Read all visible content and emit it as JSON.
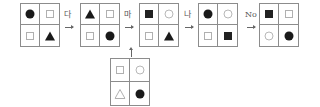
{
  "sequence": {
    "grids": [
      {
        "id": "grid-1",
        "cells": [
          "circle-filled",
          "square-empty",
          "square-empty",
          "triangle-filled"
        ]
      },
      {
        "id": "grid-2",
        "cells": [
          "triangle-filled",
          "square-empty",
          "square-empty",
          "circle-filled"
        ]
      },
      {
        "id": "grid-3",
        "cells": [
          "square-filled",
          "circle-empty",
          "square-empty",
          "triangle-filled"
        ]
      },
      {
        "id": "grid-4",
        "cells": [
          "circle-filled",
          "circle-empty",
          "square-empty",
          "square-filled"
        ]
      },
      {
        "id": "grid-5",
        "cells": [
          "square-filled",
          "square-empty",
          "circle-empty",
          "circle-filled"
        ]
      }
    ],
    "transitions": [
      {
        "label": "다"
      },
      {
        "label": "마"
      },
      {
        "label": "나"
      },
      {
        "label": "No"
      }
    ]
  },
  "input_grid": {
    "id": "grid-input",
    "cells": [
      "square-empty",
      "circle-empty",
      "triangle-empty",
      "circle-filled"
    ]
  }
}
